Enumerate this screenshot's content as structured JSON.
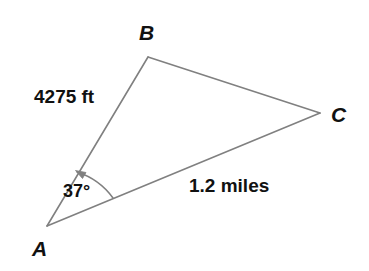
{
  "figure": {
    "type": "triangle-diagram",
    "background_color": "#ffffff",
    "line_color": "#808080",
    "text_color": "#111111"
  },
  "vertices": [
    {
      "name": "A",
      "label": "A",
      "x": 47,
      "y": 226,
      "label_x": 32,
      "label_y": 238
    },
    {
      "name": "B",
      "label": "B",
      "x": 148,
      "y": 57,
      "label_x": 139,
      "label_y": 22
    },
    {
      "name": "C",
      "label": "C",
      "x": 320,
      "y": 113,
      "label_x": 331,
      "label_y": 104
    }
  ],
  "sides": [
    {
      "name": "AB",
      "label": "4275 ft",
      "value": 4275,
      "unit": "ft"
    },
    {
      "name": "AC",
      "label": "1.2 miles",
      "value": 1.2,
      "unit": "miles"
    },
    {
      "name": "BC",
      "label": "",
      "value": null,
      "unit": ""
    }
  ],
  "angles": [
    {
      "at": "A",
      "label": "37°",
      "value": 37,
      "unit": "degrees",
      "marker": "arc-with-arrow"
    }
  ],
  "labels": {
    "vertex_a": "A",
    "vertex_b": "B",
    "vertex_c": "C",
    "side_ab": "4275 ft",
    "side_ac": "1.2 miles",
    "angle_a": "37°"
  }
}
